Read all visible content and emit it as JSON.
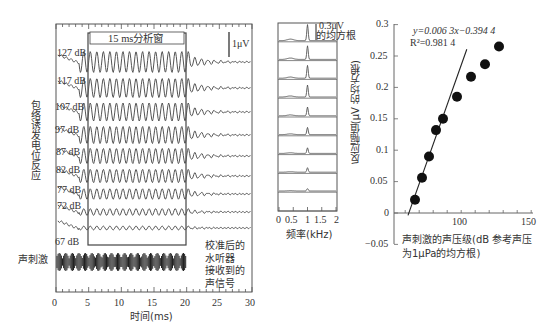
{
  "chart_data": [
    {
      "type": "line",
      "title": "",
      "panel": "left",
      "description": "Envelope following response waveforms at stimulus levels (stacked)",
      "xlabel": "时间(ms)",
      "ylabel": "包络诱发电位反应",
      "xlim": [
        0,
        30
      ],
      "x_ticks": [
        0,
        5,
        10,
        15,
        20,
        25,
        30
      ],
      "series_labels": [
        "127 dB",
        "117 dB",
        "107 dB",
        "97 dB",
        "87 dB",
        "82 dB",
        "77 dB",
        "72 dB",
        "67 dB"
      ],
      "analysis_window": {
        "label": "15 ms分析窗",
        "start_ms": 5,
        "end_ms": 20
      },
      "scale_bar": "1μV",
      "stimulus_label": "声刺激",
      "stimulus_note": [
        "校准后的",
        "水听器",
        "接收到的",
        "声信号"
      ],
      "stimulus_range_ms": [
        0,
        20
      ]
    },
    {
      "type": "line",
      "panel": "middle",
      "description": "Spectra of responses, peak at ~1 kHz, amplitude decreasing with level",
      "xlabel": "频率(kHz)",
      "xlim": [
        0,
        2
      ],
      "x_ticks": [
        "0",
        "0.5",
        "1",
        "1.5",
        "2"
      ],
      "scale_bar": [
        "0.3μV",
        "的均方根"
      ],
      "peak_frequency_khz": 1,
      "relative_peak_heights": [
        1.0,
        0.85,
        0.8,
        0.75,
        0.55,
        0.45,
        0.35,
        0.28,
        0.15
      ]
    },
    {
      "type": "scatter",
      "panel": "right",
      "xlabel": "声刺激的声压级(dB 参考声压为1μPa的均方根)",
      "ylabel": "反应幅值(μV 的均方根)",
      "xlim": [
        52,
        150
      ],
      "ylim": [
        -0.05,
        0.3
      ],
      "x_ticks": [
        100,
        150
      ],
      "y_ticks": [
        "-0.05",
        "0",
        "0.05",
        "0.1",
        "0.15",
        "0.2",
        "0.25",
        "0.3"
      ],
      "x": [
        67,
        72,
        77,
        82,
        87,
        97,
        107,
        117,
        127
      ],
      "y": [
        0.021,
        0.056,
        0.09,
        0.132,
        0.15,
        0.185,
        0.217,
        0.237,
        0.265
      ],
      "fit": {
        "equation": "y=0.006 3x−0.394 4",
        "r2": "R²=0.981 4",
        "slope": 0.0063,
        "intercept": -0.3944,
        "x_range": [
          62,
          104
        ]
      }
    }
  ],
  "left": {
    "window_label": "15 ms分析窗",
    "scale": "1μV",
    "ylabel": "包络诱发电位反应",
    "stim_label": "声刺激",
    "note": [
      "校准后的",
      "水听器",
      "接收到的",
      "声信号"
    ],
    "xlabel": "时间(ms)",
    "ticks": [
      "0",
      "5",
      "10",
      "15",
      "20",
      "25",
      "30"
    ],
    "levels": [
      "127 dB",
      "117 dB",
      "107 dB",
      "97 dB",
      "87 dB",
      "82 dB",
      "77 dB",
      "72 dB",
      "67 dB"
    ]
  },
  "middle": {
    "scale1": "0.3μV",
    "scale2": "的均方根",
    "xlabel": "频率(kHz)",
    "ticks": [
      "0",
      "0.5",
      "1",
      "1.5",
      "2"
    ]
  },
  "right": {
    "eq": "y=0.006 3x−0.394 4",
    "r2": "R²=0.981 4",
    "ylabel": "反应幅值(μV 的均方根)",
    "xlabel1": "声刺激的声压级(dB 参考声压",
    "xlabel2": "为1μPa的均方根)",
    "yticks": [
      "0.3",
      "0.25",
      "0.2",
      "0.15",
      "0.1",
      "0.05",
      "0",
      "−0.05"
    ],
    "xticks": [
      "100",
      "150"
    ]
  }
}
